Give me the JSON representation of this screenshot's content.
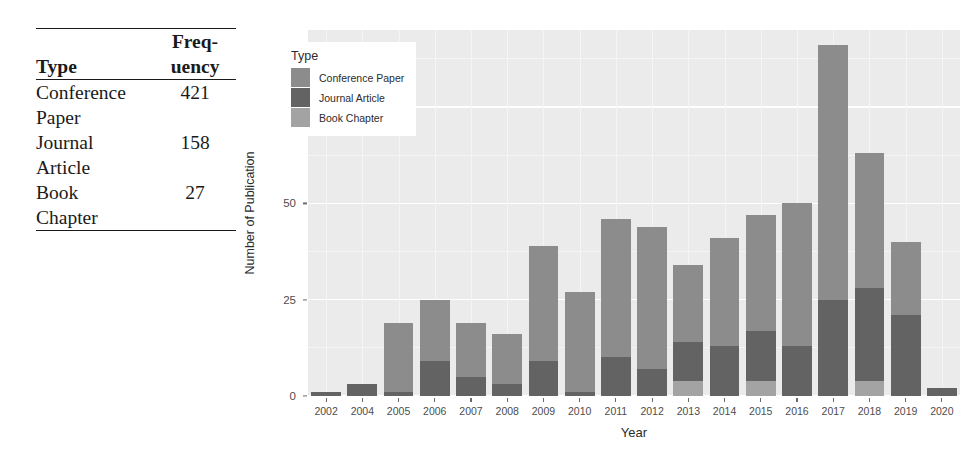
{
  "table": {
    "columns": [
      "Type",
      "Freq-\nuency"
    ],
    "header_type": "Type",
    "header_freq_line1": "Freq-",
    "header_freq_line2": "uency",
    "rows": [
      {
        "type": "Conference Paper",
        "type_line1": "Conference",
        "type_line2": "Paper",
        "frequency": "421"
      },
      {
        "type": "Journal Article",
        "type_line1": "Journal",
        "type_line2": "Article",
        "frequency": "158"
      },
      {
        "type": "Book Chapter",
        "type_line1": "Book",
        "type_line2": "Chapter",
        "frequency": "27"
      }
    ]
  },
  "chart_data": {
    "type": "bar",
    "subtype": "stacked",
    "title": "",
    "xlabel": "Year",
    "ylabel": "Number of Publication",
    "categories": [
      "2002",
      "2004",
      "2005",
      "2006",
      "2007",
      "2008",
      "2009",
      "2010",
      "2011",
      "2012",
      "2013",
      "2014",
      "2015",
      "2016",
      "2017",
      "2018",
      "2019",
      "2020"
    ],
    "series": [
      {
        "name": "Book Chapter",
        "color": "#a3a3a3",
        "values": [
          0,
          0,
          0,
          0,
          0,
          0,
          0,
          0,
          0,
          0,
          4,
          0,
          4,
          0,
          0,
          4,
          0,
          0
        ]
      },
      {
        "name": "Journal Article",
        "color": "#636363",
        "values": [
          1,
          3,
          1,
          9,
          5,
          3,
          9,
          1,
          10,
          7,
          10,
          13,
          13,
          13,
          25,
          24,
          21,
          2
        ]
      },
      {
        "name": "Conference Paper",
        "color": "#8c8c8c",
        "values": [
          0,
          0,
          18,
          16,
          14,
          13,
          30,
          26,
          36,
          37,
          20,
          28,
          30,
          37,
          66,
          35,
          19,
          0
        ]
      }
    ],
    "totals": [
      1,
      3,
      19,
      25,
      19,
      16,
      39,
      27,
      46,
      44,
      34,
      41,
      47,
      50,
      91,
      63,
      40,
      2
    ],
    "ylim": [
      0,
      95
    ],
    "yticks": [
      0,
      25,
      50,
      75
    ],
    "ytick_labels": [
      "0",
      "25",
      "50",
      "75"
    ],
    "grid": true,
    "legend": {
      "title": "Type",
      "position": "top-left-inside",
      "entries": [
        {
          "label": "Conference Paper",
          "color": "#8c8c8c"
        },
        {
          "label": "Journal Article",
          "color": "#636363"
        },
        {
          "label": "Book Chapter",
          "color": "#a3a3a3"
        }
      ]
    },
    "panel_background": "#ebebeb",
    "gridline_color": "#ffffff"
  }
}
